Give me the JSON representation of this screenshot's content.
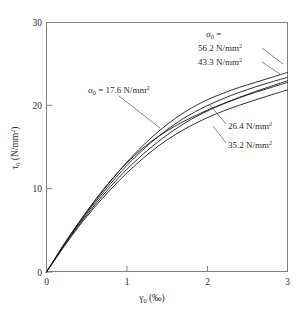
{
  "chart_data": {
    "type": "line",
    "title": "",
    "xlabel": "γ₀ (‰)",
    "ylabel": "τ₀ (N/mm²)",
    "xlim": [
      0,
      3
    ],
    "ylim": [
      0,
      30
    ],
    "xticks": [
      "0",
      "1",
      "2",
      "3"
    ],
    "yticks": [
      "0",
      "10",
      "20",
      "30"
    ],
    "xtick_values": [
      0,
      1,
      2,
      3
    ],
    "ytick_values": [
      0,
      10,
      20,
      30
    ],
    "grid": false,
    "legend_position": "annotations-on-plot",
    "x_unit": "per mille",
    "y_unit": "N/mm2",
    "series": [
      {
        "name": "σ₀ = 56.2 N/mm²",
        "sigma0": 56.2,
        "x": [
          0,
          0.1,
          0.2,
          0.3,
          0.4,
          0.5,
          0.6,
          0.7,
          0.8,
          0.9,
          1.0,
          1.2,
          1.4,
          1.6,
          1.8,
          2.0,
          2.2,
          2.4,
          2.6,
          2.8,
          3.0
        ],
        "values": [
          0,
          1.5,
          3.0,
          4.45,
          5.85,
          7.2,
          8.5,
          9.75,
          10.95,
          12.1,
          13.2,
          15.2,
          16.95,
          18.45,
          19.7,
          20.7,
          21.5,
          22.2,
          22.8,
          23.4,
          24.0
        ]
      },
      {
        "name": "σ₀ = 43.3 N/mm²",
        "sigma0": 43.3,
        "x": [
          0,
          0.1,
          0.2,
          0.3,
          0.4,
          0.5,
          0.6,
          0.7,
          0.8,
          0.9,
          1.0,
          1.2,
          1.4,
          1.6,
          1.8,
          2.0,
          2.2,
          2.4,
          2.6,
          2.8,
          3.0
        ],
        "values": [
          0,
          1.5,
          3.0,
          4.4,
          5.75,
          7.05,
          8.3,
          9.5,
          10.65,
          11.75,
          12.8,
          14.7,
          16.35,
          17.8,
          19.0,
          20.0,
          20.85,
          21.6,
          22.25,
          22.85,
          23.4
        ]
      },
      {
        "name": "σ₀ = 17.6 N/mm²",
        "sigma0": 17.6,
        "x": [
          0,
          0.1,
          0.2,
          0.3,
          0.4,
          0.5,
          0.6,
          0.7,
          0.8,
          0.9,
          1.0,
          1.2,
          1.4,
          1.6,
          1.8,
          2.0,
          2.2,
          2.4,
          2.6,
          2.8,
          3.0
        ],
        "values": [
          0,
          1.55,
          3.1,
          4.55,
          5.95,
          7.3,
          8.6,
          9.85,
          11.0,
          12.1,
          13.1,
          14.9,
          16.35,
          17.55,
          18.55,
          19.45,
          20.25,
          21.0,
          21.7,
          22.35,
          23.0
        ]
      },
      {
        "name": "σ₀ = 26.4 N/mm²",
        "sigma0": 26.4,
        "x": [
          0,
          0.1,
          0.2,
          0.3,
          0.4,
          0.5,
          0.6,
          0.7,
          0.8,
          0.9,
          1.0,
          1.2,
          1.4,
          1.6,
          1.8,
          2.0,
          2.2,
          2.4,
          2.6,
          2.8,
          3.0
        ],
        "values": [
          0,
          1.45,
          2.9,
          4.3,
          5.6,
          6.85,
          8.05,
          9.2,
          10.3,
          11.35,
          12.35,
          14.15,
          15.75,
          17.15,
          18.35,
          19.35,
          20.2,
          20.95,
          21.6,
          22.2,
          22.8
        ]
      },
      {
        "name": "σ₀ = 35.2 N/mm²",
        "sigma0": 35.2,
        "x": [
          0,
          0.1,
          0.2,
          0.3,
          0.4,
          0.5,
          0.6,
          0.7,
          0.8,
          0.9,
          1.0,
          1.2,
          1.4,
          1.6,
          1.8,
          2.0,
          2.2,
          2.4,
          2.6,
          2.8,
          3.0
        ],
        "values": [
          0,
          1.4,
          2.8,
          4.15,
          5.45,
          6.65,
          7.8,
          8.9,
          9.95,
          10.95,
          11.9,
          13.65,
          15.2,
          16.5,
          17.6,
          18.55,
          19.35,
          20.05,
          20.7,
          21.3,
          21.9
        ]
      }
    ],
    "annotations": [
      {
        "id": "sigma-header",
        "text": "σ₀ =",
        "x": 206,
        "y": 36
      },
      {
        "id": "label-56-2",
        "text": "56.2 N/mm²",
        "x": 198,
        "y": 50
      },
      {
        "id": "label-43-3",
        "text": "43.3 N/mm²",
        "x": 198,
        "y": 64
      },
      {
        "id": "label-17-6",
        "text": "σ₀ = 17.6 N/mm²",
        "x": 88,
        "y": 90
      },
      {
        "id": "label-26-4",
        "text": "26.4 N/mm²",
        "x": 228,
        "y": 128
      },
      {
        "id": "label-35-2",
        "text": "35.2 N/mm²",
        "x": 228,
        "y": 147
      }
    ]
  },
  "annotation_text": {
    "sigma_header": "σ₀ =",
    "sigma_symbol": "σ",
    "sigma_sub": "0",
    "equals": "=",
    "v56": "56.2 N/mm",
    "v43": "43.3 N/mm",
    "v176": "17.6 N/mm",
    "v26": "26.4 N/mm",
    "v35": "35.2 N/mm",
    "sup2": "2",
    "tau_symbol": "τ",
    "tau_sub": "0",
    "tau_unit": " (N/mm",
    "tau_unit_close": ")",
    "gamma_symbol": "γ",
    "gamma_sub": "0",
    "gamma_unit": " (‰)"
  },
  "axes": {
    "x_ticks": [
      "0",
      "1",
      "2",
      "3"
    ],
    "y_ticks": [
      "0",
      "10",
      "20",
      "30"
    ]
  },
  "colors": {
    "curve": "#1a1a1a",
    "frame": "#808080",
    "text": "#2b2b2b",
    "leader": "#555555",
    "background": "#ffffff"
  }
}
